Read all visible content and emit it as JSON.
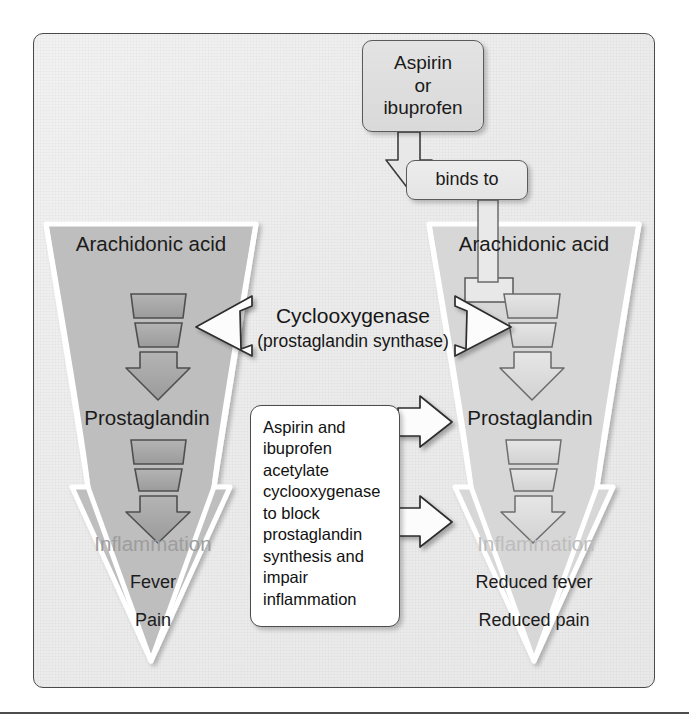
{
  "figure": {
    "type": "biology-mechanism-diagram"
  },
  "drug_box": {
    "line1": "Aspirin",
    "line2": "or",
    "line3": "ibuprofen"
  },
  "binds_box": {
    "label": "binds to"
  },
  "enzyme_label": {
    "name": "Cyclooxygenase",
    "alias": "(prostaglandin synthase)"
  },
  "left_pathway": {
    "title": "Arachidonic acid",
    "product": "Prostaglandin",
    "outcome": "Inflammation",
    "effects": [
      "Fever",
      "Pain"
    ]
  },
  "right_pathway": {
    "title": "Arachidonic acid",
    "product": "Prostaglandin",
    "outcome": "Inflammation",
    "effects": [
      "Reduced fever",
      "Reduced pain"
    ]
  },
  "mechanism_box": {
    "text": "Aspirin and ibuprofen acetylate cyclooxygenase to block prostaglandin synthesis and impair inflammation"
  },
  "colors": {
    "panel_background": "#ececec",
    "panel_border": "#4a4a4a",
    "left_funnel_fill": "#bdbdbd",
    "right_funnel_fill": "#d6d6d6",
    "funnel_outline": "#ffffff",
    "segment_dark": "#a6a6a6",
    "segment_light": "#dedede",
    "segment_stroke": "#4f4f4f",
    "text_primary": "#1a1a1a",
    "text_ghost_left": "#9d9d9d",
    "text_ghost_right": "#bdbdbd",
    "box_fill": "#e0e0e0",
    "mechanism_box_fill": "#ffffff",
    "white_arrow_fill": "#fbfbfb"
  }
}
